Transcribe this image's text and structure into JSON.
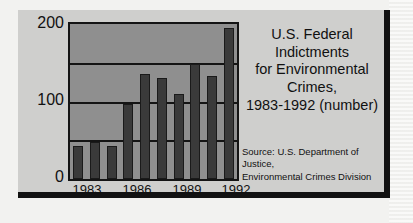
{
  "chart_data": {
    "type": "bar",
    "title": "U.S. Federal Indictments for Environmental Crimes, 1983-1992 (number)",
    "title_lines": [
      "U.S. Federal Indictments",
      "for Environmental Crimes,",
      "1983-1992 (number)"
    ],
    "source_lines": [
      "Source: U.S. Department of Justice,",
      "Environmental Crimes Division"
    ],
    "xlabel": "",
    "ylabel": "",
    "ylim": [
      0,
      200
    ],
    "grid": true,
    "gridline_values": [
      50,
      100,
      150,
      200
    ],
    "ytick_labels": [
      "0",
      "100",
      "200"
    ],
    "ytick_values": [
      0,
      100,
      200
    ],
    "xtick_labels": [
      "1983",
      "1986",
      "1989",
      "1992"
    ],
    "xtick_years": [
      1983,
      1986,
      1989,
      1992
    ],
    "categories": [
      1983,
      1984,
      1985,
      1986,
      1987,
      1988,
      1989,
      1990,
      1991,
      1992
    ],
    "values": [
      43,
      48,
      43,
      97,
      135,
      130,
      110,
      148,
      133,
      195
    ],
    "colors": {
      "bar_fill": "#3a3a3a",
      "bar_edge": "#1a1a1a",
      "plot_background": "#8f8f8f",
      "card_background": "#cfcfcd",
      "axis": "#141414",
      "text": "#111111",
      "page_background": "#f2f2f0"
    }
  }
}
